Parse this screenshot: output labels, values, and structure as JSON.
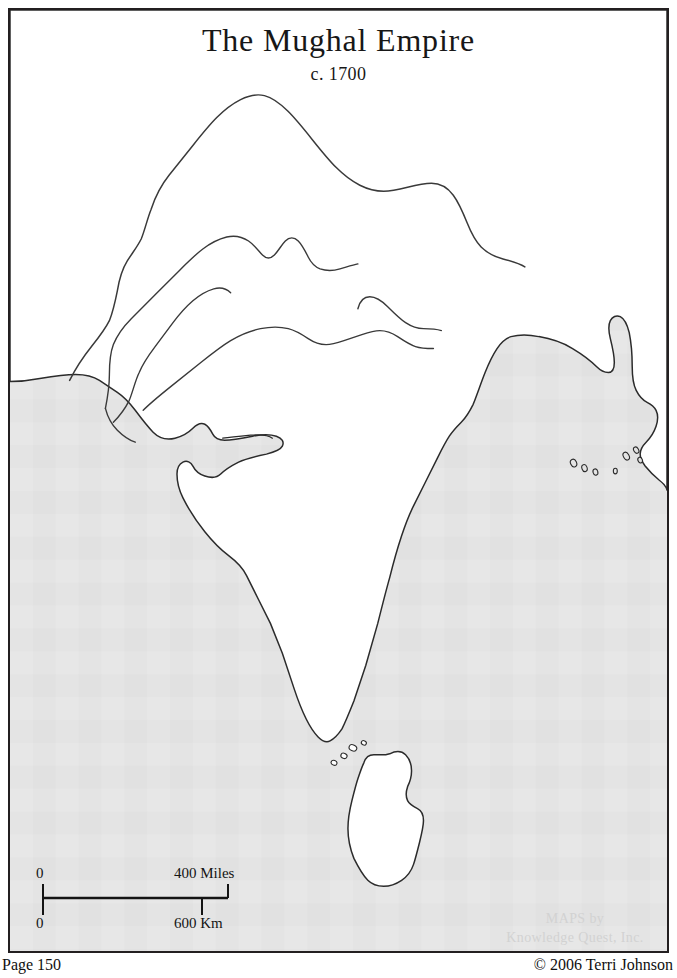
{
  "page": {
    "width": 677,
    "height": 978,
    "background_color": "#ffffff"
  },
  "map": {
    "title": "The Mughal Empire",
    "subtitle": "c. 1700",
    "region": "South Asia / Indian subcontinent",
    "land_color": "#ffffff",
    "sea_color": "#e4e4e4",
    "outline_color": "#2b2b2b",
    "frame_color": "#231f20",
    "features": [
      "northern mountain frontier arc",
      "Indus river system",
      "Ganges river",
      "Indus delta",
      "Gulf of Kutch",
      "Kathiawar peninsula",
      "Gulf of Khambhat",
      "Deccan peninsula",
      "Ganges-Brahmaputra delta",
      "Bay of Bengal coast islands",
      "Adam's Bridge islets",
      "Sri Lanka"
    ]
  },
  "scale": {
    "miles_zero": "0",
    "miles_max": "400 Miles",
    "km_zero": "0",
    "km_max": "600 Km"
  },
  "watermark": {
    "line1": "MAPS by",
    "line2": "Knowledge Quest, Inc."
  },
  "footer": {
    "page_number": "Page 150",
    "copyright": "© 2006 Terri Johnson"
  }
}
